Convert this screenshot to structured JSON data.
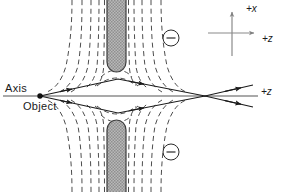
{
  "figure": {
    "background_color": "#ffffff",
    "width": 291,
    "height": 192
  },
  "labels": {
    "axis": "Axis",
    "object": "Object",
    "plus_x": "+x",
    "plus_z_key": "+z",
    "plus_z_ray": "+z"
  },
  "colors": {
    "ink": "#1a1a1a",
    "axis_line": "#8c8c8c",
    "field_line": "#4d4d4d",
    "electrode_fill": "#a6a6a6",
    "electrode_edge": "#3d3d3d",
    "ray": "#1a1a1a",
    "key_line": "#8a8a8a"
  },
  "electrodes": [
    {
      "name": "upper-electrode",
      "charge_symbol": "−",
      "x": 107,
      "y": -6,
      "width": 19,
      "height": 78,
      "rounded_end": "bottom"
    },
    {
      "name": "lower-electrode",
      "charge_symbol": "−",
      "x": 107,
      "y": 120,
      "width": 19,
      "height": 78,
      "rounded_end": "top"
    }
  ],
  "charge_badges": [
    {
      "name": "upper-minus-badge",
      "symbol": "−",
      "cx": 171,
      "cy": 38,
      "r": 8
    },
    {
      "name": "lower-minus-badge",
      "symbol": "−",
      "cx": 171,
      "cy": 152,
      "r": 8
    }
  ],
  "optical_axis": {
    "name": "optical-axis",
    "x1": 3,
    "x2": 258,
    "y": 96
  },
  "object_point": {
    "name": "object-point",
    "x": 40,
    "y": 96,
    "r": 2.6
  },
  "focus_point": {
    "name": "focus-point",
    "x": 205,
    "y": 96
  },
  "rays": [
    {
      "name": "ray-upper",
      "start": [
        40,
        96
      ],
      "apex": [
        118,
        79
      ],
      "focus": [
        205,
        96
      ],
      "end": [
        253,
        85
      ]
    },
    {
      "name": "ray-lower",
      "start": [
        40,
        96
      ],
      "apex": [
        118,
        113
      ],
      "focus": [
        205,
        96
      ],
      "end": [
        253,
        107
      ]
    }
  ],
  "ray_arrow_positions": [
    {
      "t": 0.33,
      "ray": "upper"
    },
    {
      "t": 0.78,
      "ray": "upper"
    },
    {
      "t": 0.33,
      "ray": "lower"
    },
    {
      "t": 0.78,
      "ray": "lower"
    }
  ],
  "equipotentials": {
    "style": "dashed",
    "dash_pattern": "5 3.5",
    "count_per_side": 5,
    "description": "Dashed equipotential lines bending around the rounded electrode tips and crossing near the axis"
  },
  "axis_key": {
    "name": "coordinate-key",
    "origin": [
      232,
      33
    ],
    "x_arrow_to": [
      232,
      8
    ],
    "z_arrow_to": [
      258,
      33
    ],
    "x_tail_to": [
      232,
      56
    ],
    "z_tail_to": [
      208,
      33
    ]
  }
}
